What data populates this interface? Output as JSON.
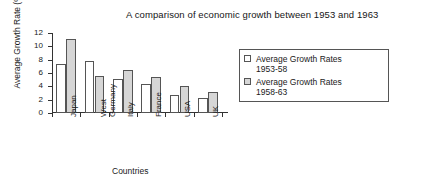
{
  "chart_data": {
    "type": "bar",
    "title": "A comparison of economic growth between 1953 and 1963",
    "xlabel": "Countries",
    "ylabel": "Average Growth Rate (%)",
    "categories": [
      "Japan",
      "West Germany",
      "Italy",
      "France",
      "USA",
      "UK"
    ],
    "series": [
      {
        "name": "Average Growth Rates 1953-58",
        "values": [
          7.3,
          7.8,
          5.1,
          4.3,
          2.7,
          2.2
        ],
        "color": "#ffffff"
      },
      {
        "name": "Average Growth Rates 1958-63",
        "values": [
          11.1,
          5.6,
          6.4,
          5.4,
          4.0,
          3.2
        ],
        "color": "#d6d6d6"
      }
    ],
    "ylim": [
      0,
      12
    ],
    "yticks": [
      0,
      2,
      4,
      6,
      8,
      10,
      12
    ],
    "ytick_labels": [
      "0",
      "2",
      "4",
      "6",
      "8",
      "10",
      "12"
    ],
    "grid": false,
    "legend_position": "right"
  },
  "legend": {
    "entries": [
      {
        "label_line1": "Average Growth Rates",
        "label_line2": "1953-58"
      },
      {
        "label_line1": "Average Growth Rates",
        "label_line2": "1958-63"
      }
    ]
  }
}
